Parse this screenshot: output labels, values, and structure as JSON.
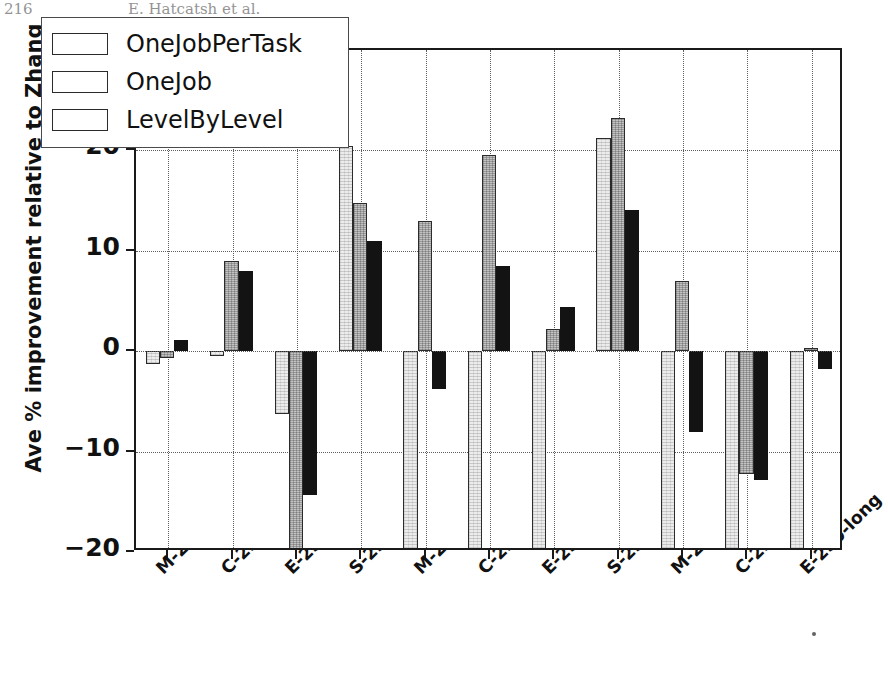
{
  "running_head": {
    "folio": "216",
    "authors": "E. Hatcatsh et al."
  },
  "chart_data": {
    "type": "bar",
    "title": "",
    "xlabel": "",
    "ylabel": "Ave % improvement relative to Zhang",
    "ylim": [
      -20,
      30
    ],
    "yticks": [
      -20,
      -10,
      0,
      10,
      20,
      30
    ],
    "ytick_labels": [
      "−20",
      "−10",
      "0",
      "10",
      "20",
      "30"
    ],
    "grid": "dotted, both axes",
    "legend_position": "upper left (inside axes)",
    "zero_reference_line": 0,
    "categories": [
      "M-250-short",
      "C-250-short",
      "E-250-short",
      "S-250-short",
      "M-250-medium",
      "C-250-medium",
      "E-250-medium",
      "S-250-medium",
      "M-250-long",
      "C-250-long",
      "E-250-long"
    ],
    "series": [
      {
        "name": "OneJobPerTask",
        "values": [
          -1.3,
          -0.5,
          -6.3,
          20.4,
          -24.0,
          -24.0,
          -23.5,
          21.2,
          -24.5,
          -24.0,
          -23.5
        ],
        "clipped_below_axis": [
          false,
          false,
          false,
          false,
          true,
          true,
          true,
          false,
          true,
          true,
          true
        ]
      },
      {
        "name": "OneJob",
        "values": [
          -0.7,
          9.0,
          -26.0,
          14.8,
          13.0,
          19.5,
          2.2,
          23.2,
          7.0,
          -12.2,
          0.3
        ],
        "clipped_below_axis": [
          false,
          false,
          true,
          false,
          false,
          false,
          false,
          false,
          false,
          false,
          false
        ]
      },
      {
        "name": "LevelByLevel",
        "values": [
          1.1,
          8.0,
          -14.3,
          11.0,
          -3.8,
          8.5,
          4.4,
          14.1,
          -8.0,
          -12.8,
          -1.8
        ],
        "clipped_below_axis": [
          false,
          false,
          false,
          false,
          false,
          false,
          false,
          false,
          false,
          false,
          false
        ]
      }
    ],
    "series_colors": [
      "#ececec",
      "#c3c3c3",
      "#131313"
    ]
  },
  "legend": {
    "entries": [
      {
        "label": "OneJobPerTask"
      },
      {
        "label": "OneJob"
      },
      {
        "label": "LevelByLevel"
      }
    ]
  }
}
